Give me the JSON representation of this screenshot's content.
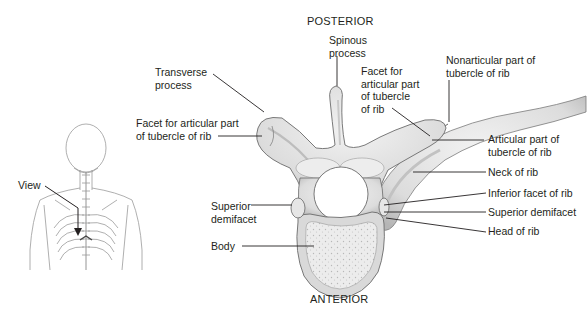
{
  "figure": {
    "orientation": {
      "top": "POSTERIOR",
      "bottom": "ANTERIOR"
    },
    "inset": {
      "label": "View"
    },
    "labels": {
      "spinous_process": [
        "Spinous",
        "process"
      ],
      "transverse_process": [
        "Transverse",
        "process"
      ],
      "facet_left": [
        "Facet for articular part",
        "of tubercle of rib"
      ],
      "facet_center": [
        "Facet for",
        "articular part",
        "of tubercle",
        "of rib"
      ],
      "nonarticular": [
        "Nonarticular part of",
        "tubercle of rib"
      ],
      "articular_part": [
        "Articular part of",
        "tubercle of rib"
      ],
      "neck_of_rib": "Neck of rib",
      "inferior_facet": "Inferior facet of rib",
      "superior_demifacet_right": "Superior demifacet",
      "head_of_rib": "Head of rib",
      "superior_demifacet_left": [
        "Superior",
        "demifacet"
      ],
      "body": "Body"
    },
    "colors": {
      "bone": "#e4e4e4",
      "bone_shadow": "#b9b9b9",
      "outline": "#6b6b6b",
      "leader": "#231f20"
    }
  }
}
